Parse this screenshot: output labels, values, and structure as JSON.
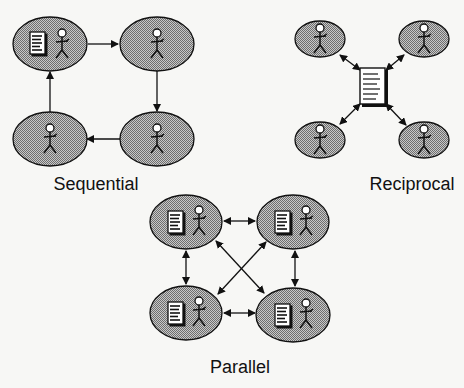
{
  "diagram": {
    "colors": {
      "node_fill": "#a9a9a9",
      "stroke": "#111111",
      "background": "#f7f7f5",
      "doc_fill": "#ffffff"
    },
    "sequential": {
      "label": "Sequential",
      "nodes": [
        {
          "id": "s1",
          "cx": 50,
          "cy": 44,
          "has_document": true
        },
        {
          "id": "s2",
          "cx": 157,
          "cy": 44,
          "has_document": false
        },
        {
          "id": "s3",
          "cx": 157,
          "cy": 139,
          "has_document": false
        },
        {
          "id": "s4",
          "cx": 50,
          "cy": 139,
          "has_document": false
        }
      ],
      "edges": [
        [
          "s1",
          "s2",
          "forward"
        ],
        [
          "s2",
          "s3",
          "forward"
        ],
        [
          "s3",
          "s4",
          "forward"
        ],
        [
          "s4",
          "s1",
          "forward"
        ]
      ]
    },
    "reciprocal": {
      "label": "Reciprocal",
      "hub": {
        "icon": "document-icon",
        "x": 360,
        "y": 68,
        "w": 26,
        "h": 37
      },
      "nodes": [
        {
          "id": "r1",
          "cx": 320,
          "cy": 39
        },
        {
          "id": "r2",
          "cx": 424,
          "cy": 39
        },
        {
          "id": "r3",
          "cx": 320,
          "cy": 140
        },
        {
          "id": "r4",
          "cx": 424,
          "cy": 140
        }
      ],
      "edges": [
        [
          "r1",
          "hub",
          "both"
        ],
        [
          "r2",
          "hub",
          "both"
        ],
        [
          "r3",
          "hub",
          "both"
        ],
        [
          "r4",
          "hub",
          "both"
        ]
      ]
    },
    "parallel": {
      "label": "Parallel",
      "nodes": [
        {
          "id": "p1",
          "cx": 186,
          "cy": 222,
          "has_document": true
        },
        {
          "id": "p2",
          "cx": 293,
          "cy": 222,
          "has_document": true
        },
        {
          "id": "p3",
          "cx": 186,
          "cy": 313,
          "has_document": true
        },
        {
          "id": "p4",
          "cx": 293,
          "cy": 315,
          "has_document": true
        }
      ],
      "edges": [
        [
          "p1",
          "p2",
          "both"
        ],
        [
          "p1",
          "p3",
          "both"
        ],
        [
          "p2",
          "p4",
          "both"
        ],
        [
          "p3",
          "p4",
          "both"
        ],
        [
          "p1",
          "p4",
          "both"
        ],
        [
          "p2",
          "p3",
          "both"
        ]
      ]
    }
  }
}
